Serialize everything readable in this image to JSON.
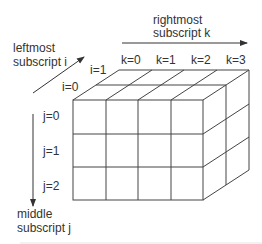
{
  "diagram": {
    "type": "3d-array-illustration",
    "axes": {
      "i": {
        "label_line1": "leftmost",
        "label_line2": "subscript i",
        "ticks": [
          "i=0",
          "i=1"
        ]
      },
      "j": {
        "label_line1": "middle",
        "label_line2": "subscript j",
        "ticks": [
          "j=0",
          "j=1",
          "j=2"
        ]
      },
      "k": {
        "label_line1": "rightmost",
        "label_line2": "subscript k",
        "ticks": [
          "k=0",
          "k=1",
          "k=2",
          "k=3"
        ]
      }
    },
    "dimensions": {
      "i": 2,
      "j": 3,
      "k": 4
    },
    "colors": {
      "line": "#444444",
      "text": "#333333",
      "background": "#ffffff"
    }
  }
}
